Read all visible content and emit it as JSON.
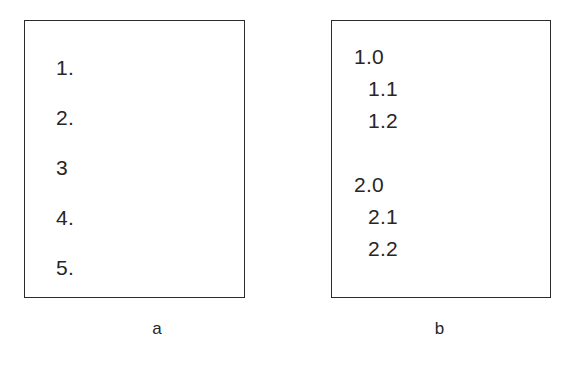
{
  "figure": {
    "background_color": "#ffffff",
    "border_color": "#2b2b2b",
    "text_color": "#262626"
  },
  "panels": [
    {
      "id": "a",
      "caption": "a",
      "list_type": "flat-numbered",
      "items": [
        {
          "label": "1.",
          "level": 1
        },
        {
          "label": "2.",
          "level": 1
        },
        {
          "label": "3",
          "level": 1
        },
        {
          "label": "4.",
          "level": 1
        },
        {
          "label": "5.",
          "level": 1
        }
      ]
    },
    {
      "id": "b",
      "caption": "b",
      "list_type": "hierarchical-numbered",
      "items": [
        {
          "label": "1.0",
          "level": 1
        },
        {
          "label": "1.1",
          "level": 2
        },
        {
          "label": "1.2",
          "level": 2
        },
        {
          "label": "",
          "level": 0
        },
        {
          "label": "2.0",
          "level": 1
        },
        {
          "label": "2.1",
          "level": 2
        },
        {
          "label": "2.2",
          "level": 2
        }
      ]
    }
  ]
}
